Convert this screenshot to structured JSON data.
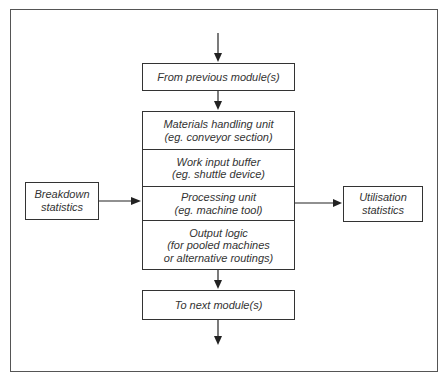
{
  "diagram": {
    "top_box": {
      "label": "From previous module(s)"
    },
    "module_stack": [
      {
        "lines": [
          "Materials handling unit",
          "(eg. conveyor section)"
        ]
      },
      {
        "lines": [
          "Work input buffer",
          "(eg. shuttle device)"
        ]
      },
      {
        "lines": [
          "Processing unit",
          "(eg. machine tool)"
        ]
      },
      {
        "lines": [
          "Output logic",
          "(for pooled machines",
          "or alternative routings)"
        ]
      }
    ],
    "bottom_box": {
      "label": "To next module(s)"
    },
    "left_box": {
      "lines": [
        "Breakdown",
        "statistics"
      ]
    },
    "right_box": {
      "lines": [
        "Utilisation",
        "statistics"
      ]
    },
    "colors": {
      "stroke": "#333333",
      "background": "#ffffff",
      "text": "#333333"
    }
  }
}
